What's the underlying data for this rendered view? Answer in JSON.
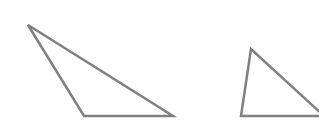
{
  "diagram": {
    "background": "#ffffff",
    "stroke_color": "#808080",
    "stroke_width": 2.5,
    "shapes": [
      {
        "name": "triangle-left",
        "points": "28,25 84,116 173,116"
      },
      {
        "name": "triangle-right",
        "points": "251,49 241,116 324,116"
      }
    ]
  }
}
